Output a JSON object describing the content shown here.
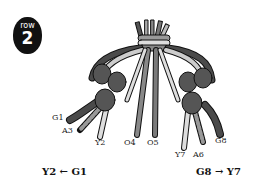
{
  "badge": {
    "label": "row",
    "number": "2"
  },
  "strand_labels": {
    "g1": "G1",
    "a3": "A3",
    "y2": "Y2",
    "o4": "O4",
    "o5": "O5",
    "y7": "Y7",
    "a6": "A6",
    "g8": "G8"
  },
  "captions": {
    "left": "Y2 ← G1",
    "right": "G8 → Y7"
  },
  "colors": {
    "dark_strand": "#4a4a4a",
    "mid_strand": "#7a7a7a",
    "light_strand": "#c8c8c8",
    "knot": "#555555",
    "outline": "#111111"
  }
}
